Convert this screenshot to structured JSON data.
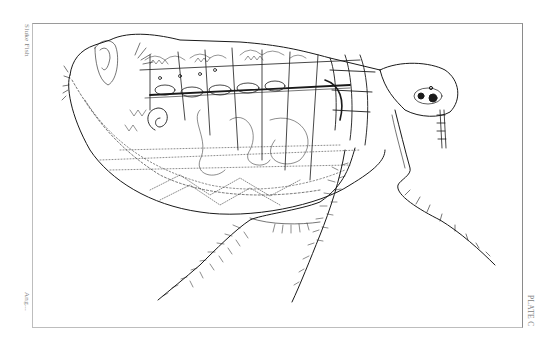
{
  "plate": {
    "subject": "Flea (Siphonaptera) anatomical engraving, lateral view",
    "margin_text": {
      "top_left": "Sluke Fish",
      "bottom_left": "Ang...",
      "bottom_right": "PLATE C"
    }
  },
  "colors": {
    "background": "#ffffff",
    "ink": "#1a1a1a",
    "frame": "#9a9a9a",
    "margin_text": "#7d7d7d"
  }
}
